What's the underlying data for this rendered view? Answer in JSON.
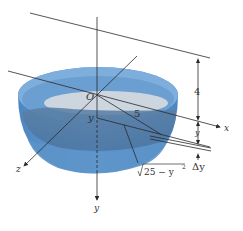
{
  "figure": {
    "labels": {
      "origin": "O",
      "x_axis": "x",
      "y_axis": "y",
      "z_axis": "z",
      "radius": "5",
      "depth_var": "y",
      "height_above": "4",
      "dim_y": "y",
      "delta_y": "Δy",
      "slice_radius": "√25 − y²",
      "slice_radius_base": "25 − y",
      "slice_radius_exp": "2"
    },
    "colors": {
      "bowl_outer": "#5b93cc",
      "bowl_inner_light": "#8cb6de",
      "water_surface": "#c9d3dc",
      "water_body": "#4f7fae",
      "line": "#2a2a2a"
    }
  }
}
